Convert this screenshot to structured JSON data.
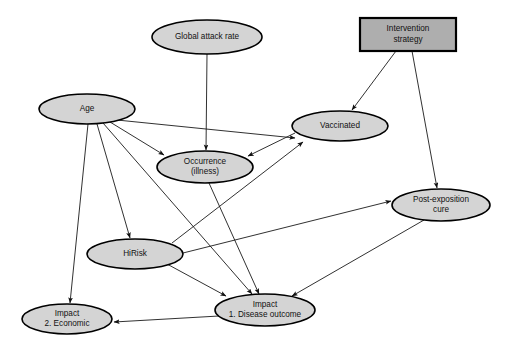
{
  "diagram": {
    "type": "influence-diagram",
    "background_color": "#ffffff",
    "node_fill_color": "#d4d4d4",
    "decision_node_fill_color": "#aeaeae",
    "node_stroke_color": "#000000",
    "edge_color": "#1a1a1a",
    "nodes": [
      {
        "id": "global_attack_rate",
        "label": "Global attack rate",
        "lines": [
          "Global attack rate"
        ],
        "shape": "ellipse",
        "cx": 207,
        "cy": 37,
        "rx": 55,
        "ry": 17
      },
      {
        "id": "intervention_strategy",
        "label": "Intervention strategy",
        "lines": [
          "Intervention",
          "strategy"
        ],
        "shape": "rect",
        "x": 360,
        "y": 18,
        "w": 96,
        "h": 33
      },
      {
        "id": "age",
        "label": "Age",
        "lines": [
          "Age"
        ],
        "shape": "ellipse",
        "cx": 87,
        "cy": 109,
        "rx": 48,
        "ry": 15
      },
      {
        "id": "vaccinated",
        "label": "Vaccinated",
        "lines": [
          "Vaccinated"
        ],
        "shape": "ellipse",
        "cx": 340,
        "cy": 126,
        "rx": 48,
        "ry": 15
      },
      {
        "id": "occurrence_illness",
        "label": "Occurrence (illness)",
        "lines": [
          "Occurrence",
          "(illness)"
        ],
        "shape": "ellipse",
        "cx": 205,
        "cy": 167,
        "rx": 48,
        "ry": 16
      },
      {
        "id": "post_exposition_cure",
        "label": "Post-exposition cure",
        "lines": [
          "Post-exposition",
          "cure"
        ],
        "shape": "ellipse",
        "cx": 441,
        "cy": 205,
        "rx": 49,
        "ry": 16
      },
      {
        "id": "hirisk",
        "label": "HiRisk",
        "lines": [
          "HiRisk"
        ],
        "shape": "ellipse",
        "cx": 135,
        "cy": 254,
        "rx": 48,
        "ry": 15
      },
      {
        "id": "impact_disease_outcome",
        "label": "Impact 1. Disease outcome",
        "lines": [
          "Impact",
          "1. Disease outcome"
        ],
        "shape": "ellipse",
        "cx": 265,
        "cy": 310,
        "rx": 50,
        "ry": 16
      },
      {
        "id": "impact_economic",
        "label": "Impact 2. Economic",
        "lines": [
          "Impact",
          "2. Economic"
        ],
        "shape": "ellipse",
        "cx": 67,
        "cy": 319,
        "rx": 45,
        "ry": 15
      }
    ],
    "edges": [
      {
        "from": "global_attack_rate",
        "to": "occurrence_illness",
        "x1": 207,
        "y1": 54,
        "x2": 206,
        "y2": 150
      },
      {
        "from": "intervention_strategy",
        "to": "vaccinated",
        "x1": 396,
        "y1": 51,
        "x2": 352,
        "y2": 110
      },
      {
        "from": "intervention_strategy",
        "to": "post_exposition_cure",
        "x1": 412,
        "y1": 51,
        "x2": 437,
        "y2": 188
      },
      {
        "from": "age",
        "to": "occurrence_illness",
        "x1": 110,
        "y1": 122,
        "x2": 164,
        "y2": 155
      },
      {
        "from": "age",
        "to": "vaccinated",
        "x1": 117,
        "y1": 120,
        "x2": 295,
        "y2": 138
      },
      {
        "from": "age",
        "to": "hirisk",
        "x1": 97,
        "y1": 124,
        "x2": 130,
        "y2": 238
      },
      {
        "from": "age",
        "to": "impact_disease_outcome",
        "x1": 103,
        "y1": 123,
        "x2": 252,
        "y2": 294
      },
      {
        "from": "age",
        "to": "impact_economic",
        "x1": 88,
        "y1": 124,
        "x2": 70,
        "y2": 303
      },
      {
        "from": "vaccinated",
        "to": "occurrence_illness",
        "x1": 295,
        "y1": 133,
        "x2": 248,
        "y2": 156
      },
      {
        "from": "occurrence_illness",
        "to": "impact_disease_outcome",
        "x1": 209,
        "y1": 183,
        "x2": 259,
        "y2": 294
      },
      {
        "from": "hirisk",
        "to": "vaccinated",
        "x1": 172,
        "y1": 243,
        "x2": 303,
        "y2": 142
      },
      {
        "from": "hirisk",
        "to": "post_exposition_cure",
        "x1": 183,
        "y1": 253,
        "x2": 391,
        "y2": 201
      },
      {
        "from": "hirisk",
        "to": "impact_disease_outcome",
        "x1": 167,
        "y1": 264,
        "x2": 226,
        "y2": 296
      },
      {
        "from": "post_exposition_cure",
        "to": "impact_disease_outcome",
        "x1": 424,
        "y1": 220,
        "x2": 292,
        "y2": 296
      },
      {
        "from": "impact_disease_outcome",
        "to": "impact_economic",
        "x1": 219,
        "y1": 316,
        "x2": 114,
        "y2": 322
      }
    ]
  }
}
